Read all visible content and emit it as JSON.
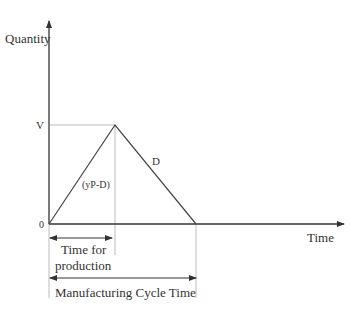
{
  "diagram": {
    "type": "inventory-cycle",
    "y_axis_label": "Quantity",
    "x_axis_label": "Time",
    "origin_label": "0",
    "peak_label": "V",
    "rising_slope_label": "(yP-D)",
    "falling_slope_label": "D",
    "production_time_label_line1": "Time for",
    "production_time_label_line2": "production",
    "cycle_time_label": "Manufacturing Cycle Time",
    "colors": {
      "line": "#444444",
      "guide": "#bbbbbb",
      "text": "#333333"
    }
  }
}
